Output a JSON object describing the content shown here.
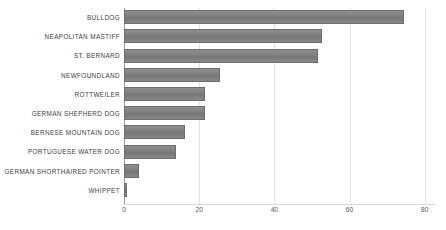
{
  "chart_data": {
    "type": "bar",
    "orientation": "horizontal",
    "title": "",
    "subtitle": "",
    "xlabel": "",
    "ylabel": "",
    "categories": [
      "BULLDOG",
      "NEAPOLITAN MASTIFF",
      "ST. BERNARD",
      "NEWFOUNDLAND",
      "ROTTWEILER",
      "GERMAN SHEPHERD DOG",
      "BERNESE MOUNTAIN DOG",
      "PORTUGUESE WATER DOG",
      "GERMAN SHORTHAIRED POINTER",
      "WHIPPET"
    ],
    "values": [
      74.5,
      52.7,
      51.6,
      25.5,
      21.5,
      21.5,
      16.2,
      13.8,
      4.0,
      0.8
    ],
    "xlim": [
      0,
      83
    ],
    "xticks": [
      0,
      20,
      40,
      60,
      80
    ],
    "xticklabels": [
      "0",
      "20",
      "40",
      "60",
      "80"
    ],
    "grid": true,
    "grid_axis": "x",
    "legend": false,
    "bar_color": "#7e7e7e",
    "bar_edge_color": "#6d6d6d",
    "grid_color": "#e2e2e2",
    "axis_color": "#9a9a9a",
    "label_color": "#3d3d3d",
    "tick_label_color": "#555555",
    "background_color": "#ffffff"
  }
}
